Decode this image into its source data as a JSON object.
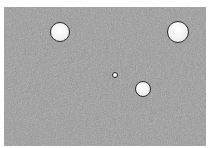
{
  "image": {
    "description": "Grainy gray background with four white circular spots outlined in dark rims",
    "background_color": "#9a9a9a",
    "margin_color": "#ffffff",
    "circles": [
      {
        "cx": 60,
        "cy": 32,
        "r": 10
      },
      {
        "cx": 178,
        "cy": 32,
        "r": 11
      },
      {
        "cx": 115,
        "cy": 75,
        "r": 3
      },
      {
        "cx": 143,
        "cy": 89,
        "r": 8
      }
    ]
  }
}
